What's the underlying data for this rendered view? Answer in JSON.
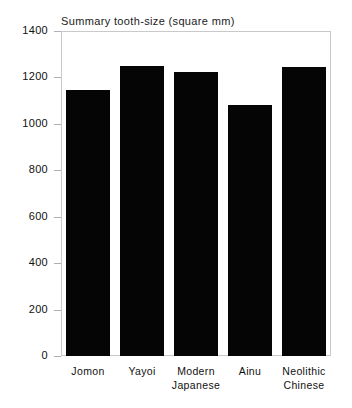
{
  "chart_data": {
    "type": "bar",
    "title": "Summary tooth-size (square mm)",
    "xlabel": "",
    "ylabel": "",
    "categories": [
      "Jomon",
      "Yayoi",
      "Modern Japanese",
      "Ainu",
      "Neolithic Chinese"
    ],
    "category_lines": [
      [
        "Jomon"
      ],
      [
        "Yayoi"
      ],
      [
        "Modern",
        "Japanese"
      ],
      [
        "Ainu"
      ],
      [
        "Neolithic",
        "Chinese"
      ]
    ],
    "values": [
      1145,
      1250,
      1222,
      1080,
      1243
    ],
    "ylim": [
      0,
      1400
    ],
    "yticks": [
      0,
      200,
      400,
      600,
      800,
      1000,
      1200,
      1400
    ],
    "ytick_labels": [
      "0",
      "200",
      "400",
      "600",
      "800",
      "1000",
      "1200",
      "1400"
    ],
    "grid": false,
    "legend": false,
    "bar_color": "#050505",
    "frame_color": "#c9c9c9",
    "background_color": "#ffffff"
  }
}
